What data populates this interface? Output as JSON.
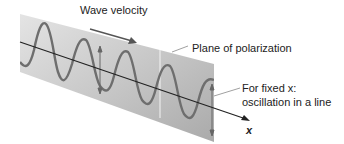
{
  "diagram": {
    "labels": {
      "wave_velocity": "Wave velocity",
      "plane": "Plane of polarization",
      "fixed_x_line1": "For fixed x:",
      "fixed_x_line2": "oscillation in a line",
      "axis": "x"
    },
    "colors": {
      "plane_light": "#e2e2e2",
      "plane_dark": "#b4b4b4",
      "wave": "#6e6e6e",
      "axis": "#222222"
    }
  }
}
